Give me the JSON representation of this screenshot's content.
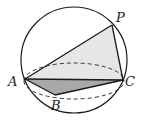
{
  "figure": {
    "labels": {
      "A": "A",
      "B": "B",
      "C": "C",
      "P": "P"
    },
    "points": {
      "A": [
        25,
        79
      ],
      "B": [
        55,
        95
      ],
      "C": [
        123,
        80
      ],
      "P": [
        112,
        25
      ]
    },
    "sphere": {
      "cx": 74,
      "cy": 60,
      "r": 53
    },
    "equator": {
      "cx": 74,
      "cy": 81,
      "rx": 50,
      "ry": 18
    },
    "colors": {
      "stroke": "#1a1a1a",
      "face_pac": "#e6e6e6",
      "face_abc": "#a9a9a9"
    }
  }
}
